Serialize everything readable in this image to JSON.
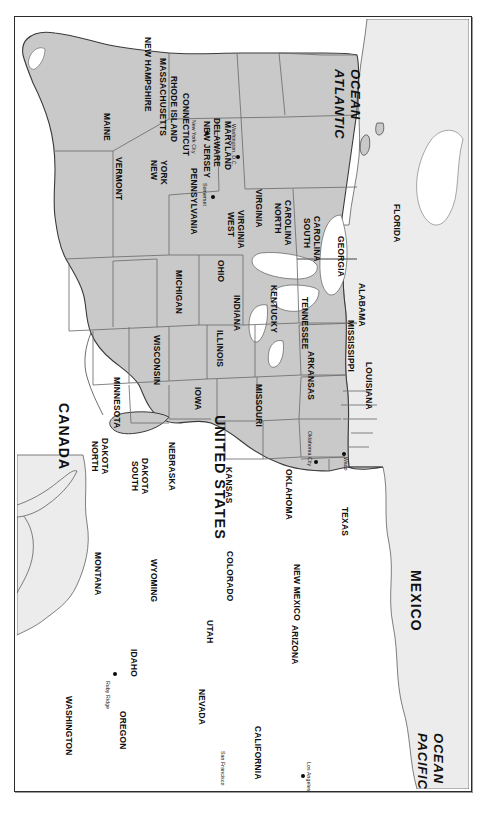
{
  "figure": {
    "orientation": "landscape map printed sideways on a portrait page"
  },
  "colors": {
    "state_fill": "#c9c9c9",
    "neighbor_fill": "#ececec",
    "water_fill": "#ffffff",
    "state_border": "#6e6e6e",
    "country_border": "#3a3a3a",
    "coast_line": "#4a4a4a",
    "frame": "#2b2b2b",
    "label_text": "#101010",
    "city_dot": "#0a0a0a"
  },
  "countries": [
    {
      "name": "CANADA",
      "x": 56,
      "y": 386
    },
    {
      "name": "MEXICO",
      "x": 408,
      "y": 553
    },
    {
      "name": "UNITED STATES",
      "x": 212,
      "y": 398
    }
  ],
  "oceans": [
    {
      "name": "ATLANTIC",
      "line2": "OCEAN",
      "x": 331,
      "y": 52
    },
    {
      "name": "PACIFIC",
      "line2": "OCEAN",
      "x": 414,
      "y": 716
    }
  ],
  "states": [
    {
      "name": "MAINE",
      "x": 96,
      "y": 96,
      "size": "normal"
    },
    {
      "name": "NEW HAMPSHIRE",
      "x": 137,
      "y": 20,
      "size": "normal"
    },
    {
      "name": "MASSACHUSETTS",
      "x": 152,
      "y": 41,
      "size": "normal"
    },
    {
      "name": "RHODE ISLAND",
      "x": 163,
      "y": 59,
      "size": "normal"
    },
    {
      "name": "CONNECTICUT",
      "x": 175,
      "y": 76,
      "size": "normal"
    },
    {
      "name": "NEW JERSEY",
      "x": 196,
      "y": 104,
      "size": "normal"
    },
    {
      "name": "DELAWARE",
      "x": 206,
      "y": 101,
      "size": "normal"
    },
    {
      "name": "MARYLAND",
      "x": 217,
      "y": 104,
      "size": "normal"
    },
    {
      "name": "VERMONT",
      "x": 108,
      "y": 140,
      "size": "normal"
    },
    {
      "name": "NEW",
      "x": 143,
      "y": 143,
      "size": "normal"
    },
    {
      "name": "YORK",
      "x": 153,
      "y": 143,
      "size": "normal"
    },
    {
      "name": "PENNSYLVANIA",
      "x": 183,
      "y": 151,
      "size": "normal"
    },
    {
      "name": "WEST",
      "x": 220,
      "y": 195,
      "size": "normal"
    },
    {
      "name": "VIRGINIA",
      "x": 230,
      "y": 193,
      "size": "normal"
    },
    {
      "name": "VIRGINIA",
      "x": 248,
      "y": 172,
      "size": "normal"
    },
    {
      "name": "NORTH",
      "x": 267,
      "y": 186,
      "size": "normal"
    },
    {
      "name": "CAROLINA",
      "x": 277,
      "y": 183,
      "size": "normal"
    },
    {
      "name": "SOUTH",
      "x": 296,
      "y": 201,
      "size": "normal"
    },
    {
      "name": "CAROLINA",
      "x": 306,
      "y": 199,
      "size": "normal"
    },
    {
      "name": "GEORGIA",
      "x": 330,
      "y": 219,
      "size": "normal"
    },
    {
      "name": "FLORIDA",
      "x": 386,
      "y": 187,
      "size": "normal"
    },
    {
      "name": "ALABAMA",
      "x": 351,
      "y": 266,
      "size": "normal"
    },
    {
      "name": "MISSISSIPPI",
      "x": 340,
      "y": 303,
      "size": "normal"
    },
    {
      "name": "LOUISIANA",
      "x": 358,
      "y": 345,
      "size": "normal"
    },
    {
      "name": "ARKANSAS",
      "x": 300,
      "y": 334,
      "size": "normal"
    },
    {
      "name": "TENNESSEE",
      "x": 294,
      "y": 280,
      "size": "normal"
    },
    {
      "name": "KENTUCKY",
      "x": 263,
      "y": 268,
      "size": "normal"
    },
    {
      "name": "OHIO",
      "x": 210,
      "y": 243,
      "size": "normal"
    },
    {
      "name": "INDIANA",
      "x": 226,
      "y": 278,
      "size": "normal"
    },
    {
      "name": "ILLINOIS",
      "x": 209,
      "y": 313,
      "size": "normal"
    },
    {
      "name": "MICHIGAN",
      "x": 168,
      "y": 253,
      "size": "normal"
    },
    {
      "name": "WISCONSIN",
      "x": 146,
      "y": 318,
      "size": "normal"
    },
    {
      "name": "MINNESOTA",
      "x": 106,
      "y": 360,
      "size": "normal"
    },
    {
      "name": "IOWA",
      "x": 187,
      "y": 370,
      "size": "normal"
    },
    {
      "name": "MISSOURI",
      "x": 248,
      "y": 367,
      "size": "normal"
    },
    {
      "name": "NORTH",
      "x": 84,
      "y": 424,
      "size": "normal"
    },
    {
      "name": "DAKOTA",
      "x": 94,
      "y": 421,
      "size": "normal"
    },
    {
      "name": "SOUTH",
      "x": 124,
      "y": 444,
      "size": "normal"
    },
    {
      "name": "DAKOTA",
      "x": 134,
      "y": 441,
      "size": "normal"
    },
    {
      "name": "NEBRASKA",
      "x": 161,
      "y": 425,
      "size": "normal"
    },
    {
      "name": "KANSAS",
      "x": 218,
      "y": 450,
      "size": "normal"
    },
    {
      "name": "OKLAHOMA",
      "x": 278,
      "y": 452,
      "size": "normal"
    },
    {
      "name": "TEXAS",
      "x": 334,
      "y": 490,
      "size": "normal"
    },
    {
      "name": "NEW MEXICO",
      "x": 286,
      "y": 547,
      "size": "normal"
    },
    {
      "name": "ARIZONA",
      "x": 284,
      "y": 608,
      "size": "normal"
    },
    {
      "name": "COLORADO",
      "x": 219,
      "y": 534,
      "size": "normal"
    },
    {
      "name": "UTAH",
      "x": 199,
      "y": 603,
      "size": "normal"
    },
    {
      "name": "WYOMING",
      "x": 143,
      "y": 542,
      "size": "normal"
    },
    {
      "name": "MONTANA",
      "x": 87,
      "y": 535,
      "size": "normal"
    },
    {
      "name": "IDAHO",
      "x": 123,
      "y": 632,
      "size": "normal"
    },
    {
      "name": "NEVADA",
      "x": 191,
      "y": 672,
      "size": "normal"
    },
    {
      "name": "CALIFORNIA",
      "x": 247,
      "y": 709,
      "size": "normal"
    },
    {
      "name": "OREGON",
      "x": 112,
      "y": 694,
      "size": "normal"
    },
    {
      "name": "WASHINGTON",
      "x": 58,
      "y": 679,
      "size": "normal"
    }
  ],
  "cities": [
    {
      "name": "New York City",
      "dot_x": 192,
      "dot_y": 116,
      "label_x": 181,
      "label_y": 103
    },
    {
      "name": "Washington, D.C.",
      "dot_x": 223,
      "dot_y": 140,
      "label_x": 221,
      "label_y": 107
    },
    {
      "name": "Somerset",
      "dot_x": 198,
      "dot_y": 180,
      "label_x": 192,
      "label_y": 166
    },
    {
      "name": "Oklahoma City",
      "dot_x": 301,
      "dot_y": 445,
      "label_x": 297,
      "label_y": 414
    },
    {
      "name": "Waco",
      "dot_x": 329,
      "dot_y": 437,
      "label_x": 333,
      "label_y": 440
    },
    {
      "name": "Ruby Ridge",
      "dot_x": 100,
      "dot_y": 657,
      "label_x": 95,
      "label_y": 664
    },
    {
      "name": "San Francisco",
      "dot_x": 217,
      "dot_y": 776,
      "label_x": 210,
      "label_y": 734
    },
    {
      "name": "Los Angeles",
      "dot_x": 288,
      "dot_y": 759,
      "label_x": 296,
      "label_y": 745
    }
  ],
  "legend": {
    "note": "No legend, scale bar, or north arrow is rendered on this plate."
  }
}
